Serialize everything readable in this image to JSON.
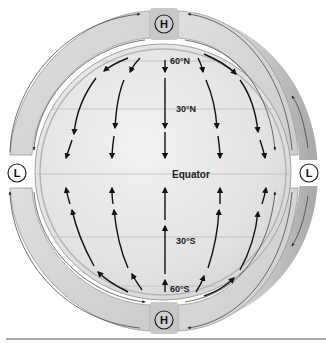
{
  "diagram": {
    "labels": {
      "lat_60n": "60°N",
      "lat_30n": "30°N",
      "equator": "Equator",
      "lat_30s": "30°S",
      "lat_60s": "60°S"
    },
    "pressure_nodes": {
      "north_pole": "H",
      "south_pole": "H",
      "equator_left": "L",
      "equator_right": "L"
    },
    "surface_wind_direction": {
      "northern_hemisphere": "north-to-south (toward equator)",
      "southern_hemisphere": "south-to-north (toward equator)"
    },
    "colors": {
      "globe_fill": "#e6e6e6",
      "band_fill": "#d9d9d9",
      "shadow": "#b8b8b8",
      "arrow": "#111111",
      "gridline": "#bdbdbd"
    }
  }
}
